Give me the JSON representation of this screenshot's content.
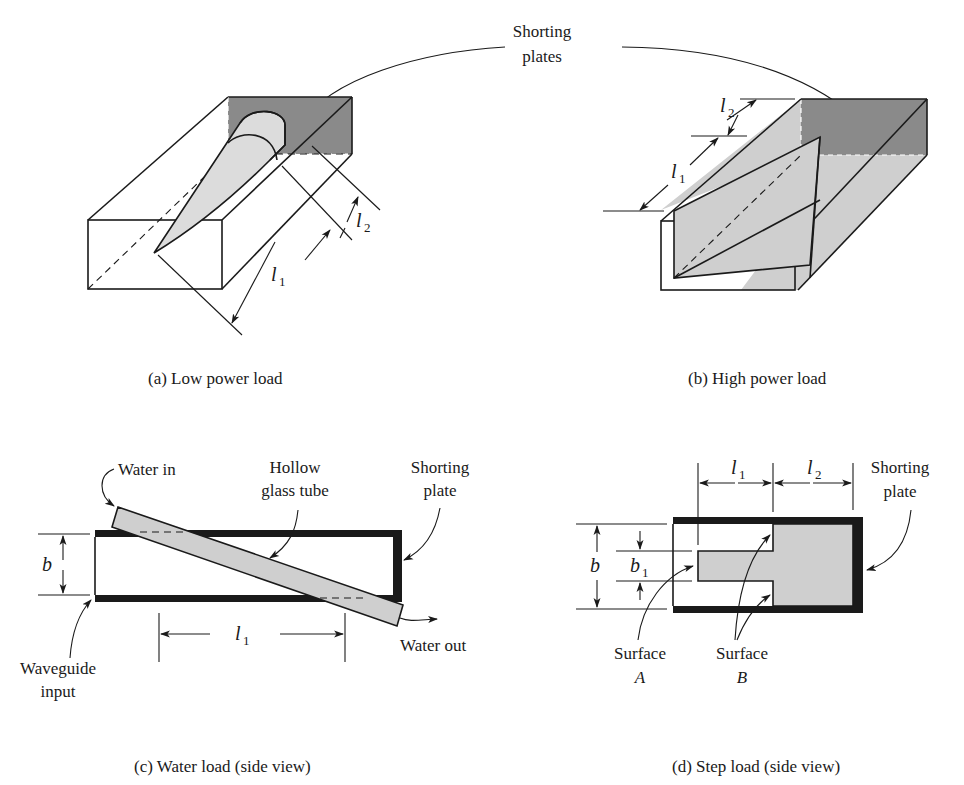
{
  "figure": {
    "top_callout": {
      "line1": "Shorting",
      "line2": "plates"
    },
    "panels": [
      {
        "id": "a",
        "caption": "(a)  Low power load",
        "dimensions": [
          {
            "symbol": "l",
            "subscript": "1"
          },
          {
            "symbol": "l",
            "subscript": "2"
          }
        ]
      },
      {
        "id": "b",
        "caption": "(b)  High power load",
        "dimensions": [
          {
            "symbol": "l",
            "subscript": "1"
          },
          {
            "symbol": "l",
            "subscript": "2"
          }
        ]
      },
      {
        "id": "c",
        "caption": "(c)  Water load (side view)",
        "labels": {
          "water_in": "Water in",
          "tube_line1": "Hollow",
          "tube_line2": "glass tube",
          "plate_line1": "Shorting",
          "plate_line2": "plate",
          "water_out": "Water out",
          "input_line1": "Waveguide",
          "input_line2": "input"
        },
        "dimensions": [
          {
            "symbol": "b",
            "subscript": ""
          },
          {
            "symbol": "l",
            "subscript": "1"
          }
        ]
      },
      {
        "id": "d",
        "caption": "(d)  Step load (side view)",
        "labels": {
          "plate_line1": "Shorting",
          "plate_line2": "plate",
          "surface_a_line1": "Surface",
          "surface_a_line2": "A",
          "surface_b_line1": "Surface",
          "surface_b_line2": "B"
        },
        "dimensions": [
          {
            "symbol": "l",
            "subscript": "1"
          },
          {
            "symbol": "l",
            "subscript": "2"
          },
          {
            "symbol": "b",
            "subscript": ""
          },
          {
            "symbol": "b",
            "subscript": "1"
          }
        ]
      }
    ],
    "colors": {
      "ink": "#1a1a1a",
      "shorting_plate_fill": "#8a8a8a",
      "absorber_fill": "#cfcfcf",
      "background": "#ffffff"
    }
  }
}
